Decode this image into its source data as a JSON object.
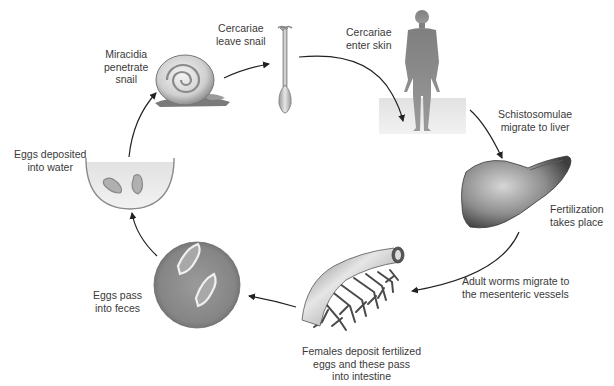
{
  "diagram": {
    "title": "",
    "type": "life-cycle",
    "stages": [
      {
        "id": "miracidia",
        "lines": [
          "Miracidia",
          "penetrate",
          "snail"
        ],
        "icon": "snail-icon"
      },
      {
        "id": "cercariae-leave",
        "lines": [
          "Cercariae",
          "leave snail"
        ],
        "icon": "cercaria-icon"
      },
      {
        "id": "cercariae-enter",
        "lines": [
          "Cercariae",
          "enter skin"
        ],
        "icon": "human-figure-icon"
      },
      {
        "id": "schistosomulae",
        "lines": [
          "Schistosomulae",
          "migrate to liver"
        ],
        "icon": ""
      },
      {
        "id": "fertilization",
        "lines": [
          "Fertilization",
          "takes place"
        ],
        "icon": "liver-icon"
      },
      {
        "id": "adult-worms",
        "lines": [
          "Adult worms migrate to",
          "the mesenteric vessels"
        ],
        "icon": ""
      },
      {
        "id": "females-deposit",
        "lines": [
          "Females deposit fertilized",
          "eggs and these pass",
          "into intestine"
        ],
        "icon": "mesenteric-vessel-icon"
      },
      {
        "id": "eggs-feces",
        "lines": [
          "Eggs pass",
          "into feces"
        ],
        "icon": "feces-eggs-icon"
      },
      {
        "id": "eggs-water",
        "lines": [
          "Eggs deposited",
          "into water"
        ],
        "icon": "water-bowl-eggs-icon"
      }
    ],
    "flow": [
      "miracidia -> cercariae-leave",
      "cercariae-leave -> cercariae-enter",
      "cercariae-enter -> schistosomulae",
      "schistosomulae -> fertilization",
      "fertilization -> adult-worms",
      "adult-worms -> females-deposit",
      "females-deposit -> eggs-feces",
      "eggs-feces -> eggs-water",
      "eggs-water -> miracidia"
    ],
    "colors": {
      "arrow": "#222222",
      "text": "#3a3a3a",
      "water": "#dcdcdc",
      "figure": "#8a8a8a"
    }
  }
}
